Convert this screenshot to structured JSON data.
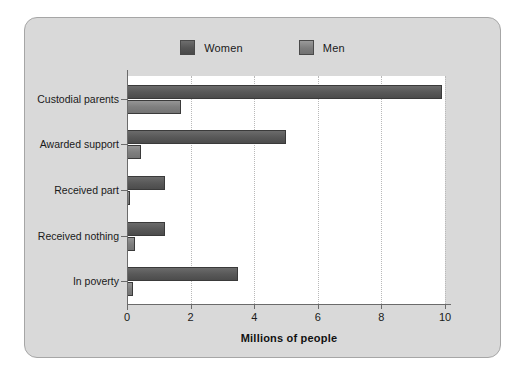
{
  "chart_data": {
    "type": "bar",
    "orientation": "horizontal",
    "title": "",
    "xlabel": "Millions of people",
    "ylabel": "",
    "categories": [
      "Custodial parents",
      "Awarded support",
      "Received part",
      "Received nothing",
      "In poverty"
    ],
    "series": [
      {
        "name": "Women",
        "color": "#565656",
        "values": [
          9.9,
          5.0,
          1.2,
          1.2,
          3.5
        ]
      },
      {
        "name": "Men",
        "color": "#7e7e7e",
        "values": [
          1.7,
          0.45,
          0.1,
          0.25,
          0.2
        ]
      }
    ],
    "xlim": [
      0,
      10
    ],
    "xticks": [
      0,
      2,
      4,
      6,
      8,
      10
    ],
    "xtick_labels": [
      "0",
      "2",
      "4",
      "6",
      "8",
      "10"
    ],
    "grid": true,
    "grid_axis": "x",
    "legend_position": "top-center"
  },
  "legend": {
    "items": [
      {
        "label": "Women",
        "swatch": "women-swatch"
      },
      {
        "label": "Men",
        "swatch": "men-swatch"
      }
    ]
  },
  "figure": {
    "background": "#d9d9d9",
    "plot_background": "#ffffff",
    "border_color": "#a6a6a6"
  }
}
